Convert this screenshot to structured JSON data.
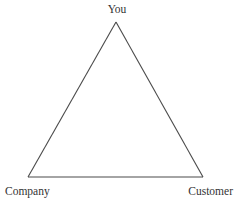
{
  "diagram": {
    "type": "triangle",
    "stroke_color": "#4a4a4a",
    "text_color": "#333333",
    "background": "#ffffff",
    "nodes": [
      {
        "id": "you",
        "label": "You",
        "position": "top"
      },
      {
        "id": "company",
        "label": "Company",
        "position": "bottom-left"
      },
      {
        "id": "customer",
        "label": "Customer",
        "position": "bottom-right"
      }
    ],
    "edges": [
      {
        "from": "you",
        "to": "company"
      },
      {
        "from": "you",
        "to": "customer"
      },
      {
        "from": "company",
        "to": "customer"
      }
    ]
  }
}
